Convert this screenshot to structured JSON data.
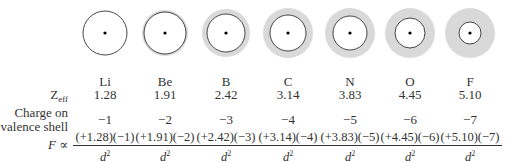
{
  "row_labels": {
    "zeff_main": "Z",
    "zeff_sub": "eff",
    "charge_line1": "Charge on",
    "charge_line2": "valence shell",
    "force_symbol": "F",
    "force_relation": "∝"
  },
  "denominator": {
    "base": "d",
    "exp": "2"
  },
  "colors": {
    "shell_fill": "#d9d9d9",
    "outline": "#333333"
  },
  "elements": [
    {
      "symbol": "Li",
      "zeff": "1.28",
      "charge": "−1",
      "numerator": "(+1.28)(−1)",
      "inner_r": 22,
      "outer_r": 22
    },
    {
      "symbol": "Be",
      "zeff": "1.91",
      "charge": "−2",
      "numerator": "(+1.91)(−2)",
      "inner_r": 21,
      "outer_r": 23
    },
    {
      "symbol": "B",
      "zeff": "2.42",
      "charge": "−3",
      "numerator": "(+2.42)(−3)",
      "inner_r": 19,
      "outer_r": 24
    },
    {
      "symbol": "C",
      "zeff": "3.14",
      "charge": "−4",
      "numerator": "(+3.14)(−4)",
      "inner_r": 18,
      "outer_r": 25
    },
    {
      "symbol": "N",
      "zeff": "3.83",
      "charge": "−5",
      "numerator": "(+3.83)(−5)",
      "inner_r": 17,
      "outer_r": 25
    },
    {
      "symbol": "O",
      "zeff": "4.45",
      "charge": "−6",
      "numerator": "(+4.45)(−6)",
      "inner_r": 15,
      "outer_r": 25
    },
    {
      "symbol": "F",
      "zeff": "5.10",
      "charge": "−7",
      "numerator": "(+5.10)(−7)",
      "inner_r": 11,
      "outer_r": 25
    }
  ]
}
